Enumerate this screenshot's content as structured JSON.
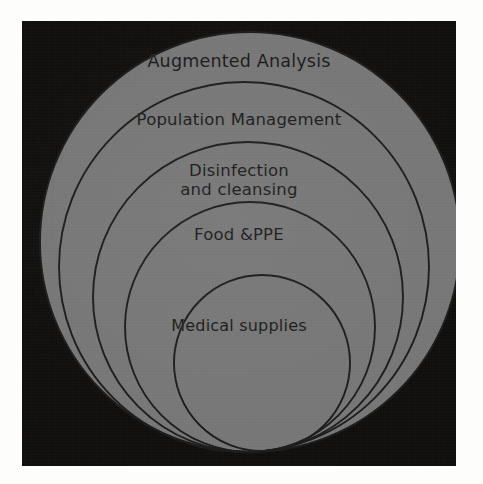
{
  "figure": {
    "kind": "nested-circles-onion-diagram",
    "background_color": "#fdfdfc",
    "panel_color": "#0e0d0c",
    "ring_fill_color": "#757575",
    "ring_stroke_color": "#1a1a1a",
    "label_color": "#191919"
  },
  "rings": [
    {
      "index": 0,
      "label": "Augmented Analysis",
      "level": "outermost",
      "cx": 228,
      "cy": 221,
      "r": 210
    },
    {
      "index": 1,
      "label": "Population Management",
      "level": "2",
      "cx": 222,
      "cy": 246,
      "r": 185
    },
    {
      "index": 2,
      "label": "Disinfection\nand cleansing",
      "level": "3",
      "cx": 226,
      "cy": 276,
      "r": 155
    },
    {
      "index": 3,
      "label": "Food &PPE",
      "level": "4",
      "cx": 228,
      "cy": 306,
      "r": 125
    },
    {
      "index": 4,
      "label": "Medical supplies",
      "level": "innermost",
      "cx": 240,
      "cy": 342,
      "r": 88
    }
  ]
}
